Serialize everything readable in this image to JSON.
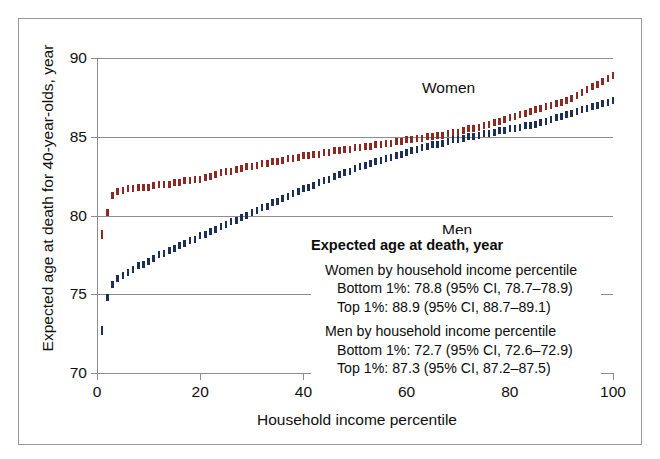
{
  "chart_data": {
    "type": "scatter",
    "title": "",
    "xlabel": "Household income percentile",
    "ylabel": "Expected age at death for 40-year-olds, year",
    "xlim": [
      0,
      100
    ],
    "ylim": [
      70,
      90
    ],
    "xticks": [
      0,
      20,
      40,
      60,
      80,
      100
    ],
    "yticks": [
      70,
      75,
      80,
      85,
      90
    ],
    "grid": true,
    "legend_position": "inline-annotations",
    "series": [
      {
        "name": "Women",
        "color": "#8a2a22",
        "label_text": "Women",
        "x": [
          1,
          2,
          3,
          4,
          5,
          6,
          7,
          8,
          9,
          10,
          11,
          12,
          13,
          14,
          15,
          16,
          17,
          18,
          19,
          20,
          21,
          22,
          23,
          24,
          25,
          26,
          27,
          28,
          29,
          30,
          31,
          32,
          33,
          34,
          35,
          36,
          37,
          38,
          39,
          40,
          41,
          42,
          43,
          44,
          45,
          46,
          47,
          48,
          49,
          50,
          51,
          52,
          53,
          54,
          55,
          56,
          57,
          58,
          59,
          60,
          61,
          62,
          63,
          64,
          65,
          66,
          67,
          68,
          69,
          70,
          71,
          72,
          73,
          74,
          75,
          76,
          77,
          78,
          79,
          80,
          81,
          82,
          83,
          84,
          85,
          86,
          87,
          88,
          89,
          90,
          91,
          92,
          93,
          94,
          95,
          96,
          97,
          98,
          99,
          100
        ],
        "y": [
          78.8,
          80.2,
          81.3,
          81.5,
          81.6,
          81.7,
          81.7,
          81.8,
          81.8,
          81.8,
          81.9,
          82.0,
          82.0,
          82.0,
          82.1,
          82.1,
          82.2,
          82.2,
          82.3,
          82.3,
          82.4,
          82.5,
          82.6,
          82.7,
          82.8,
          82.8,
          82.9,
          83.0,
          83.1,
          83.1,
          83.2,
          83.3,
          83.3,
          83.4,
          83.4,
          83.5,
          83.6,
          83.6,
          83.7,
          83.8,
          83.8,
          83.9,
          83.9,
          84.0,
          84.0,
          84.1,
          84.1,
          84.2,
          84.2,
          84.3,
          84.3,
          84.4,
          84.4,
          84.5,
          84.5,
          84.6,
          84.6,
          84.7,
          84.7,
          84.8,
          84.8,
          84.9,
          84.9,
          85.0,
          85.0,
          85.1,
          85.1,
          85.2,
          85.3,
          85.3,
          85.4,
          85.5,
          85.5,
          85.6,
          85.7,
          85.8,
          85.9,
          86.0,
          86.1,
          86.2,
          86.3,
          86.4,
          86.5,
          86.6,
          86.7,
          86.8,
          86.9,
          87.0,
          87.1,
          87.2,
          87.3,
          87.4,
          87.6,
          87.8,
          88.0,
          88.2,
          88.3,
          88.5,
          88.7,
          88.9
        ]
      },
      {
        "name": "Men",
        "color": "#1d2f57",
        "label_text": "Men",
        "x": [
          1,
          2,
          3,
          4,
          5,
          6,
          7,
          8,
          9,
          10,
          11,
          12,
          13,
          14,
          15,
          16,
          17,
          18,
          19,
          20,
          21,
          22,
          23,
          24,
          25,
          26,
          27,
          28,
          29,
          30,
          31,
          32,
          33,
          34,
          35,
          36,
          37,
          38,
          39,
          40,
          41,
          42,
          43,
          44,
          45,
          46,
          47,
          48,
          49,
          50,
          51,
          52,
          53,
          54,
          55,
          56,
          57,
          58,
          59,
          60,
          61,
          62,
          63,
          64,
          65,
          66,
          67,
          68,
          69,
          70,
          71,
          72,
          73,
          74,
          75,
          76,
          77,
          78,
          79,
          80,
          81,
          82,
          83,
          84,
          85,
          86,
          87,
          88,
          89,
          90,
          91,
          92,
          93,
          94,
          95,
          96,
          97,
          98,
          99,
          100
        ],
        "y": [
          72.7,
          74.8,
          75.6,
          76.0,
          76.2,
          76.4,
          76.6,
          76.8,
          76.9,
          77.1,
          77.3,
          77.5,
          77.6,
          77.8,
          77.9,
          78.1,
          78.2,
          78.4,
          78.5,
          78.7,
          78.8,
          79.0,
          79.1,
          79.3,
          79.4,
          79.6,
          79.7,
          79.9,
          80.0,
          80.2,
          80.3,
          80.5,
          80.6,
          80.8,
          80.9,
          81.1,
          81.2,
          81.4,
          81.5,
          81.7,
          81.8,
          81.9,
          82.1,
          82.2,
          82.3,
          82.5,
          82.6,
          82.7,
          82.8,
          83.0,
          83.1,
          83.2,
          83.3,
          83.4,
          83.5,
          83.6,
          83.7,
          83.8,
          83.9,
          84.0,
          84.1,
          84.2,
          84.3,
          84.4,
          84.5,
          84.5,
          84.6,
          84.7,
          84.8,
          84.8,
          84.9,
          85.0,
          85.0,
          85.1,
          85.2,
          85.2,
          85.3,
          85.4,
          85.4,
          85.5,
          85.5,
          85.6,
          85.7,
          85.7,
          85.8,
          85.9,
          86.0,
          86.1,
          86.2,
          86.3,
          86.4,
          86.5,
          86.6,
          86.7,
          86.8,
          86.9,
          87.0,
          87.1,
          87.2,
          87.3
        ]
      }
    ],
    "annotations": {
      "title": "Expected age at death, year",
      "groups": [
        {
          "head": "Women by household income percentile",
          "rows": [
            "Bottom 1%: 78.8 (95% CI, 78.7–78.9)",
            "Top 1%: 88.9 (95% CI, 88.7–89.1)"
          ]
        },
        {
          "head": "Men by household income percentile",
          "rows": [
            "Bottom 1%: 72.7 (95% CI, 72.6–72.9)",
            "Top 1%: 87.3 (95% CI, 87.2–87.5)"
          ]
        }
      ]
    }
  }
}
